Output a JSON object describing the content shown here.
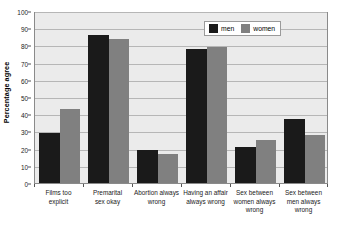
{
  "chart_data": {
    "type": "bar",
    "title": "",
    "subtitle": "",
    "xlabel": "",
    "ylabel": "Percentage agree",
    "ylim": [
      0,
      100
    ],
    "ytick_step": 10,
    "yticks": [
      0,
      10,
      20,
      30,
      40,
      50,
      60,
      70,
      80,
      90,
      100
    ],
    "grid": true,
    "legend_position": "top-right",
    "categories": [
      "Films too explicit",
      "Premarital sex okay",
      "Abortion always wrong",
      "Having an affair always wrong",
      "Sex between women always wrong",
      "Sex between men always wrong"
    ],
    "category_lines": [
      [
        "Films too",
        "explicit"
      ],
      [
        "Premarital",
        "sex okay"
      ],
      [
        "Abortion always",
        "wrong"
      ],
      [
        "Having an affair",
        "always wrong"
      ],
      [
        "Sex between",
        "women always",
        "wrong"
      ],
      [
        "Sex between",
        "men always",
        "wrong"
      ]
    ],
    "series": [
      {
        "name": "men",
        "color": "#1a1a1a",
        "values": [
          29,
          86,
          19,
          78,
          21,
          37
        ]
      },
      {
        "name": "women",
        "color": "#808080",
        "values": [
          43,
          84,
          17,
          79,
          25,
          28
        ]
      }
    ]
  },
  "legend": {
    "items": [
      {
        "label": "men",
        "swatch": "men"
      },
      {
        "label": "women",
        "swatch": "women"
      }
    ]
  },
  "colors": {
    "men": "#1a1a1a",
    "women": "#808080",
    "plot_background": "#ebebeb",
    "page_background": "#ffffff",
    "gridline": "#b6b6b6",
    "axis": "#8a8a8a"
  }
}
